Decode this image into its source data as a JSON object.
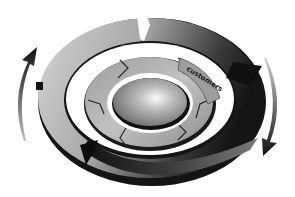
{
  "diagram": {
    "type": "concentric-cycle",
    "center": {
      "shape": "ellipse",
      "label": ""
    },
    "inner_ring": {
      "segments": 6,
      "labels": [
        "customers",
        "",
        "",
        "",
        "",
        ""
      ],
      "label_segment_text": "customers"
    },
    "outer_ring": {
      "segments": 3,
      "direction": "clockwise"
    },
    "side_arrows": [
      {
        "position": "left",
        "direction": "up"
      },
      {
        "position": "right",
        "direction": "down"
      }
    ]
  },
  "colors": {
    "background": "#ffffff",
    "dark": "#111111",
    "mid": "#8a8a8a",
    "light": "#d9d9d9",
    "highlight": "#f4f4f4"
  }
}
